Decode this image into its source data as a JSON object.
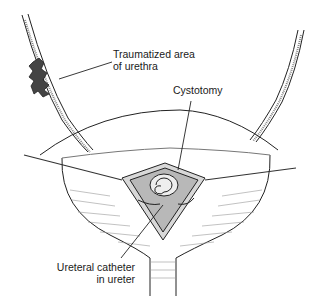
{
  "figure": {
    "labels": {
      "urethra_line1": "Traumatized area",
      "urethra_line2": "of urethra",
      "cystotomy": "Cystotomy",
      "catheter_line1": "Ureteral catheter",
      "catheter_line2": "in ureter"
    }
  }
}
